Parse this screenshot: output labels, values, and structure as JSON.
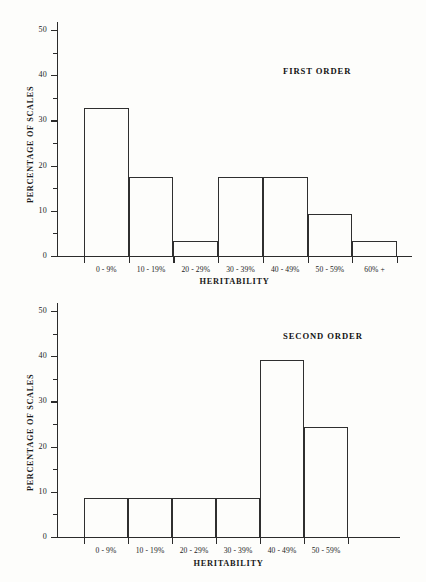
{
  "page": {
    "background_color": "#fdfdfb",
    "ink_color": "#2b2b2b"
  },
  "chart_data": [
    {
      "type": "bar",
      "title": "FIRST ORDER",
      "xlabel": "HERITABILITY",
      "ylabel": "PERCENTAGE OF SCALES",
      "categories": [
        "0 - 9%",
        "10 - 19%",
        "20 - 29%",
        "30 - 39%",
        "40 - 49%",
        "50 - 59%",
        "60% +"
      ],
      "values": [
        32.7,
        17.5,
        3.3,
        17.4,
        17.4,
        9.2,
        3.3
      ],
      "ylim": [
        0,
        50
      ],
      "yticks": [
        0,
        10,
        20,
        30,
        40,
        50
      ],
      "ytick_labels": [
        "0",
        "10",
        "20",
        "30",
        "40",
        "50"
      ],
      "yminor_step": 5,
      "grid": false,
      "legend": "none"
    },
    {
      "type": "bar",
      "title": "SECOND ORDER",
      "xlabel": "HERITABILITY",
      "ylabel": "PERCENTAGE OF SCALES",
      "categories": [
        "0 - 9%",
        "10 - 19%",
        "20 - 29%",
        "30 - 39%",
        "40 - 49%",
        "50 - 59%"
      ],
      "values": [
        8.7,
        8.7,
        8.7,
        8.7,
        39.1,
        24.3
      ],
      "ylim": [
        0,
        50
      ],
      "yticks": [
        0,
        10,
        20,
        30,
        40,
        50
      ],
      "ytick_labels": [
        "0",
        "10",
        "20",
        "30",
        "40",
        "50"
      ],
      "yminor_step": 5,
      "grid": false,
      "legend": "none"
    }
  ]
}
